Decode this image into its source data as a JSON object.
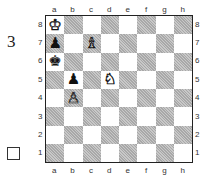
{
  "puzzle": {
    "number": "3",
    "side_to_move": "white",
    "side_to_move_marker": "empty-square-box"
  },
  "board": {
    "files": [
      "a",
      "b",
      "c",
      "d",
      "e",
      "f",
      "g",
      "h"
    ],
    "ranks": [
      "8",
      "7",
      "6",
      "5",
      "4",
      "3",
      "2",
      "1"
    ],
    "pieces": [
      {
        "square": "a8",
        "color": "white",
        "type": "king",
        "glyph": "♔"
      },
      {
        "square": "a7",
        "color": "black",
        "type": "pawn",
        "glyph": "♟"
      },
      {
        "square": "c7",
        "color": "white",
        "type": "bishop",
        "glyph": "♗"
      },
      {
        "square": "a6",
        "color": "black",
        "type": "king",
        "glyph": "♚"
      },
      {
        "square": "b5",
        "color": "black",
        "type": "pawn",
        "glyph": "♟"
      },
      {
        "square": "d5",
        "color": "white",
        "type": "knight",
        "glyph": "♘"
      },
      {
        "square": "b4",
        "color": "white",
        "type": "pawn",
        "glyph": "♙"
      }
    ],
    "colors": {
      "light": "#ffffff",
      "dark": "#b8b8b8",
      "border": "#222222"
    }
  }
}
